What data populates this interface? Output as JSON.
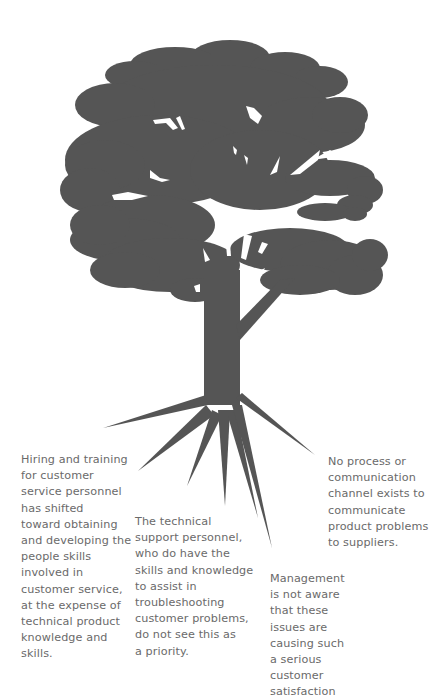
{
  "figure": {
    "type": "root-cause-tree",
    "colors": {
      "tree_fill": "#555555",
      "caption_text": "#6a6a6a",
      "background": "#ffffff"
    },
    "root_count": 7
  },
  "captions": {
    "hiring": "Hiring and training\nfor customer\nservice personnel\nhas shifted\ntoward obtaining\nand developing the\npeople skills\ninvolved in\ncustomer service,\nat the expense of\ntechnical product\nknowledge and\nskills.",
    "technical": "The technical\nsupport personnel,\nwho do have the\nskills and knowledge\nto assist in\ntroubleshooting\ncustomer problems,\ndo not see this as\na priority.",
    "management": "Management\nis not aware\nthat these\nissues are\ncausing such\na serious\ncustomer\nsatisfaction",
    "process": "No process or\ncommunication\nchannel exists to\ncommunicate\nproduct problems\nto suppliers."
  }
}
